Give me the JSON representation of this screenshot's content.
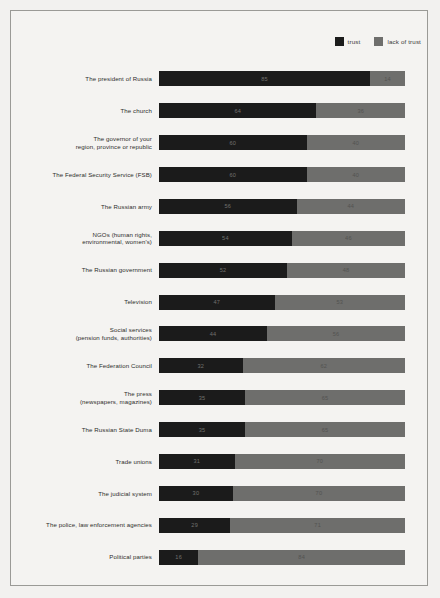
{
  "legend": {
    "entries": [
      {
        "label": "trust",
        "color": "#1b1b1b",
        "swatch_name": "legend-swatch-trust"
      },
      {
        "label": "lack of trust",
        "color": "#6e6e6c",
        "swatch_name": "legend-swatch-lack-of-trust"
      }
    ]
  },
  "chart_data": {
    "type": "bar",
    "orientation": "horizontal",
    "stacked": true,
    "title": "",
    "subtitle": "",
    "xlabel": "",
    "ylabel": "",
    "xlim": [
      0,
      100
    ],
    "grid": false,
    "legend_position": "top-right",
    "categories": [
      "The president of Russia",
      "The church",
      "The governor of your\nregion, province or republic",
      "The Federal Security Service (FSB)",
      "The Russian army",
      "NGOs (human rights,\nenvironmental, women's)",
      "The Russian government",
      "Television",
      "Social services\n(pension funds, authorities)",
      "The Federation Council",
      "The press\n(newspapers, magazines)",
      "The Russian State Duma",
      "Trade unions",
      "The judicial system",
      "The police, law enforcement agencies",
      "Political parties"
    ],
    "series": [
      {
        "name": "trust",
        "color": "#1b1b1b",
        "values": [
          85,
          64,
          60,
          60,
          56,
          54,
          52,
          47,
          44,
          32,
          35,
          35,
          31,
          30,
          29,
          16
        ]
      },
      {
        "name": "lack of trust",
        "color": "#6e6e6c",
        "values": [
          14,
          36,
          40,
          40,
          44,
          46,
          48,
          53,
          56,
          62,
          65,
          65,
          70,
          70,
          71,
          84
        ]
      }
    ]
  }
}
